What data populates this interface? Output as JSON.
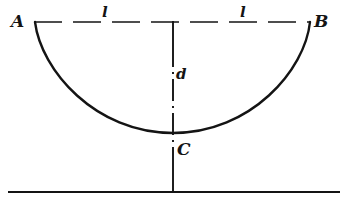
{
  "figure": {
    "type": "geometry-diagram",
    "background_color": "#ffffff",
    "stroke_color": "#141414",
    "labels": {
      "point_a": "A",
      "point_b": "B",
      "point_c": "C",
      "sag": "d",
      "half_span_left": "l",
      "half_span_right": "l"
    },
    "geometry": {
      "support_left": {
        "x": 35,
        "y": 22
      },
      "support_right": {
        "x": 310,
        "y": 22
      },
      "lowest_point": {
        "x": 173,
        "y": 133
      },
      "centerline_x": 173,
      "chord_y": 22,
      "ground_y": 192,
      "ground_x_start": 8,
      "ground_x_end": 340
    },
    "line_styles": {
      "cable": "solid",
      "chord": "dashed",
      "centerline": "dash-dot",
      "ground": "solid"
    }
  }
}
